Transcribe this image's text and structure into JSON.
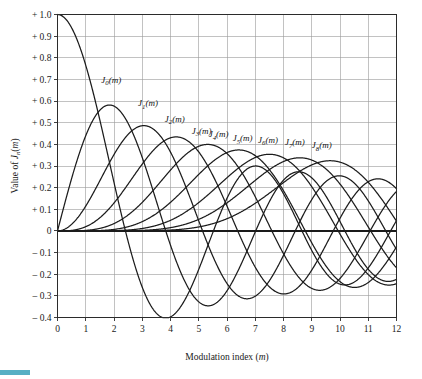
{
  "chart_data": {
    "type": "line",
    "title": "",
    "xlabel": "Modulation index (m)",
    "ylabel": "Value of J_n(m)",
    "xlim": [
      0,
      12
    ],
    "ylim": [
      -0.4,
      1.0
    ],
    "grid": true,
    "legend_position": "inline-curve-labels",
    "xticks": [
      "0",
      "1",
      "2",
      "3",
      "4",
      "5",
      "6",
      "7",
      "8",
      "9",
      "10",
      "11",
      "12"
    ],
    "xtick_values": [
      0,
      1,
      2,
      3,
      4,
      5,
      6,
      7,
      8,
      9,
      10,
      11,
      12
    ],
    "yticks": [
      "+ 1.0",
      "+ 0.9",
      "+ 0.8",
      "+ 0.7",
      "+ 0.6",
      "+ 0.5",
      "+ 0.4",
      "+ 0.3",
      "+ 0.2",
      "+ 0.1",
      "0",
      "– 0.1",
      "– 0.2",
      "– 0.3",
      "– 0.4"
    ],
    "ytick_values": [
      1.0,
      0.9,
      0.8,
      0.7,
      0.6,
      0.5,
      0.4,
      0.3,
      0.2,
      0.1,
      0,
      -0.1,
      -0.2,
      -0.3,
      -0.4
    ],
    "series": [
      {
        "name": "J0(m)",
        "order": 0,
        "label": "J",
        "subscript": "0",
        "label_suffix": "(m)",
        "label_x": 1.55,
        "label_y": 0.685,
        "peak_value": 1.0,
        "peak_at": 0.0,
        "min_value": -0.403,
        "min_at": 3.83
      },
      {
        "name": "J1(m)",
        "order": 1,
        "label": "J",
        "subscript": "1",
        "label_suffix": "(m)",
        "label_x": 2.85,
        "label_y": 0.575,
        "peak_value": 0.582,
        "peak_at": 1.84,
        "min_value": -0.346,
        "min_at": 5.33
      },
      {
        "name": "J2(m)",
        "order": 2,
        "label": "J",
        "subscript": "2",
        "label_suffix": "(m)",
        "label_x": 3.8,
        "label_y": 0.505,
        "peak_value": 0.486,
        "peak_at": 3.05,
        "min_value": -0.313,
        "min_at": 6.71
      },
      {
        "name": "J3(m)",
        "order": 3,
        "label": "J",
        "subscript": "3",
        "label_suffix": "(m)",
        "label_x": 4.75,
        "label_y": 0.448,
        "peak_value": 0.434,
        "peak_at": 4.2,
        "min_value": -0.291,
        "min_at": 8.02
      },
      {
        "name": "J4(m)",
        "order": 4,
        "label": "J",
        "subscript": "4",
        "label_suffix": "(m)",
        "label_x": 5.35,
        "label_y": 0.433,
        "peak_value": 0.4,
        "peak_at": 5.32,
        "min_value": -0.276,
        "min_at": 9.28
      },
      {
        "name": "J5(m)",
        "order": 5,
        "label": "J",
        "subscript": "5",
        "label_suffix": "(m)",
        "label_x": 6.2,
        "label_y": 0.415,
        "peak_value": 0.374,
        "peak_at": 6.41,
        "min_value": -0.263,
        "min_at": 10.52
      },
      {
        "name": "J6(m)",
        "order": 6,
        "label": "J",
        "subscript": "6",
        "label_suffix": "(m)",
        "label_x": 7.1,
        "label_y": 0.408,
        "peak_value": 0.354,
        "peak_at": 7.5,
        "min_value": -0.253,
        "min_at": 11.73
      },
      {
        "name": "J7(m)",
        "order": 7,
        "label": "J",
        "subscript": "7",
        "label_suffix": "(m)",
        "label_x": 8.05,
        "label_y": 0.395,
        "peak_value": 0.338,
        "peak_at": 8.58,
        "min_value": null,
        "min_at": null
      },
      {
        "name": "J8(m)",
        "order": 8,
        "label": "J",
        "subscript": "8",
        "label_suffix": "(m)",
        "label_x": 9.0,
        "label_y": 0.382,
        "peak_value": 0.325,
        "peak_at": 9.65,
        "min_value": null,
        "min_at": null
      }
    ]
  },
  "style": {
    "curve_color": "#1c1c1c",
    "grid_color": "#9a9a9a",
    "axis_color": "#2b2b2b",
    "background": "#ffffff",
    "accent_bar_color": "#56b0c4"
  }
}
